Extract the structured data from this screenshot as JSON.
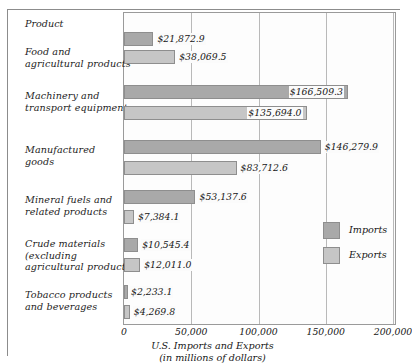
{
  "figure": {
    "category_axis_heading": "Product",
    "xlabel_line1": "U.S. Imports and Exports",
    "xlabel_line2": "(in millions of dollars)"
  },
  "legend": {
    "position": "inside-right",
    "items": [
      {
        "label": "Imports",
        "color": "#a9a9a9"
      },
      {
        "label": "Exports",
        "color": "#c6c6c6"
      }
    ]
  },
  "axis": {
    "ticks": [
      "0",
      "50,000",
      "100,000",
      "150,000",
      "200,000"
    ],
    "tick_values": [
      0,
      50000,
      100000,
      150000,
      200000
    ]
  },
  "chart_data": {
    "type": "bar",
    "orientation": "horizontal",
    "title": "",
    "subtitle": "",
    "xlabel": "U.S. Imports and Exports (in millions of dollars)",
    "ylabel": "Product",
    "xlim": [
      0,
      200000
    ],
    "xticks": [
      0,
      50000,
      100000,
      150000,
      200000
    ],
    "xticklabels": [
      "0",
      "50,000",
      "100,000",
      "150,000",
      "200,000"
    ],
    "grid": "vertical",
    "legend_position": "inside-right",
    "categories": [
      "Food and agricultural products",
      "Machinery and transport equipment",
      "Manufactured goods",
      "Mineral fuels and related products",
      "Crude materials (excluding agricultural products)",
      "Tobacco products and beverages"
    ],
    "series": [
      {
        "name": "Imports",
        "color": "#a9a9a9",
        "values": [
          21872.9,
          166509.3,
          146279.9,
          53137.6,
          10545.4,
          2233.1
        ],
        "labels": [
          "$21,872.9",
          "$166,509.3",
          "$146,279.9",
          "$53,137.6",
          "$10,545.4",
          "$2,233.1"
        ]
      },
      {
        "name": "Exports",
        "color": "#c6c6c6",
        "values": [
          38069.5,
          135694.0,
          83712.6,
          7384.1,
          12011.0,
          4269.8
        ],
        "labels": [
          "$38,069.5",
          "$135,694.0",
          "$83,712.6",
          "$7,384.1",
          "$12,011.0",
          "$4,269.8"
        ]
      }
    ]
  },
  "categories_display": [
    {
      "line1": "Food and",
      "line2": "agricultural products",
      "line3": ""
    },
    {
      "line1": "Machinery and",
      "line2": "transport equipment",
      "line3": ""
    },
    {
      "line1": "Manufactured",
      "line2": "goods",
      "line3": ""
    },
    {
      "line1": "Mineral fuels and",
      "line2": "related products",
      "line3": ""
    },
    {
      "line1": "Crude materials",
      "line2": "(excluding",
      "line3": "agricultural products)"
    },
    {
      "line1": "Tobacco products",
      "line2": "and beverages",
      "line3": ""
    }
  ]
}
